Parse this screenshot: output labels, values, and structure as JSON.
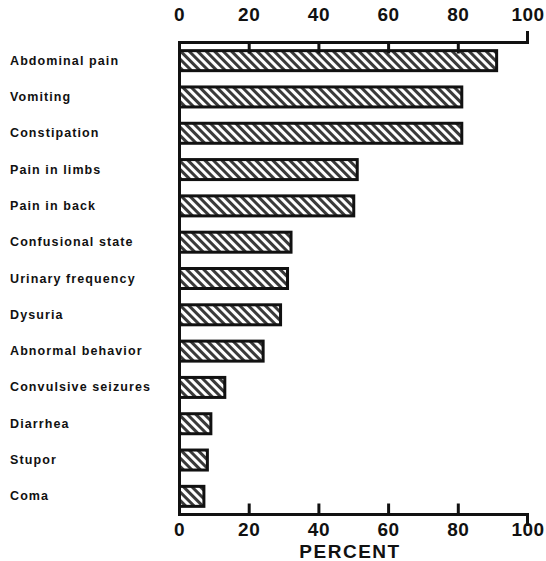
{
  "chart_data": {
    "type": "bar",
    "orientation": "horizontal",
    "title": "",
    "xlabel": "PERCENT",
    "ylabel": "",
    "xlim": [
      0,
      100
    ],
    "xticks": [
      0,
      20,
      40,
      60,
      80,
      100
    ],
    "xtick_labels": [
      "0",
      "20",
      "40",
      "60",
      "80",
      "100"
    ],
    "grid": false,
    "legend": null,
    "categories": [
      "Abdominal pain",
      "Vomiting",
      "Constipation",
      "Pain in limbs",
      "Pain in back",
      "Confusional state",
      "Urinary frequency",
      "Dysuria",
      "Abnormal behavior",
      "Convulsive seizures",
      "Diarrhea",
      "Stupor",
      "Coma"
    ],
    "values": [
      91,
      81,
      81,
      51,
      50,
      32,
      31,
      29,
      24,
      13,
      9,
      8,
      7
    ],
    "bar_style": {
      "fill": "hatch-diagonal-forward",
      "edge_color": "#111111",
      "face_color": "#ffffff"
    }
  },
  "axis": {
    "top_ticks_shown": true,
    "bottom_ticks_shown": true,
    "frame_color": "#111111"
  }
}
